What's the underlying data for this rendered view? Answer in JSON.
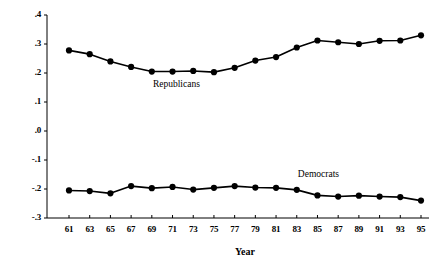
{
  "chart_data": {
    "type": "line",
    "title": "",
    "xlabel": "Year",
    "ylabel": "",
    "xlim": [
      61,
      95
    ],
    "ylim": [
      -0.3,
      0.4
    ],
    "grid": false,
    "legend_position": "inline-annotations",
    "x": [
      61,
      63,
      65,
      67,
      69,
      71,
      73,
      75,
      77,
      79,
      81,
      83,
      85,
      87,
      89,
      91,
      93,
      95
    ],
    "x_tick_labels": [
      "61",
      "63",
      "65",
      "67",
      "69",
      "71",
      "73",
      "75",
      "77",
      "79",
      "81",
      "83",
      "85",
      "87",
      "89",
      "91",
      "93",
      "95"
    ],
    "y_tick_labels": [
      ".4",
      ".3",
      ".2",
      ".1",
      ".0",
      "-.1",
      "-.2",
      "-.3"
    ],
    "y_tick_values": [
      0.4,
      0.3,
      0.2,
      0.1,
      0.0,
      -0.1,
      -0.2,
      -0.3
    ],
    "series": [
      {
        "name": "Republicans",
        "color": "#000000",
        "marker": "filled-circle",
        "label_x": 72,
        "label_y": 0.155,
        "values": [
          0.278,
          0.265,
          0.24,
          0.221,
          0.205,
          0.205,
          0.207,
          0.203,
          0.218,
          0.243,
          0.255,
          0.288,
          0.312,
          0.306,
          0.3,
          0.311,
          0.312,
          0.33
        ]
      },
      {
        "name": "Democrats",
        "color": "#000000",
        "marker": "filled-circle",
        "label_x": 86,
        "label_y": -0.155,
        "values": [
          -0.205,
          -0.207,
          -0.215,
          -0.19,
          -0.197,
          -0.193,
          -0.202,
          -0.196,
          -0.19,
          -0.195,
          -0.196,
          -0.203,
          -0.222,
          -0.226,
          -0.223,
          -0.226,
          -0.228,
          -0.24
        ]
      }
    ]
  }
}
